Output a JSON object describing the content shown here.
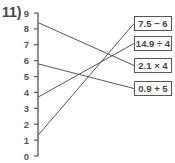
{
  "question_number": "11)",
  "axis": {
    "min": 0,
    "max": 9,
    "ticks": [
      "0",
      "1",
      "2",
      "3",
      "4",
      "5",
      "6",
      "7",
      "8",
      "9"
    ]
  },
  "boxes": [
    {
      "label": "7.5 − 6",
      "top": 16
    },
    {
      "label": "14.9 ÷ 4",
      "top": 36
    },
    {
      "label": "2.1 × 4",
      "top": 58
    },
    {
      "label": "0.9 + 5",
      "top": 81
    }
  ],
  "connections": [
    {
      "from_value": 8.4,
      "to_box": "2.1 × 4"
    },
    {
      "from_value": 5.8,
      "to_box": "0.9 + 5"
    },
    {
      "from_value": 3.7,
      "to_box": "14.9 ÷ 4"
    },
    {
      "from_value": 1.3,
      "to_box": "7.5 − 6"
    }
  ],
  "colors": {
    "line": "#555555",
    "text": "#444444"
  }
}
